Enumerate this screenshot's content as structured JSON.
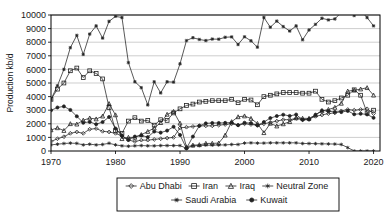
{
  "chart_data": {
    "type": "line",
    "title": "",
    "xlabel": "",
    "ylabel": "Production kb/d",
    "xlim": [
      1970,
      2021
    ],
    "ylim": [
      0,
      10000
    ],
    "ytick_step": 1000,
    "grid": "horizontal",
    "legend_position": "bottom",
    "xticks": [
      "1970",
      "1980",
      "1990",
      "2000",
      "2010",
      "2020"
    ],
    "xtick_values": [
      1970,
      1980,
      1990,
      2000,
      2010,
      2020
    ],
    "yticks": [
      "0",
      "1000",
      "2000",
      "3000",
      "4000",
      "5000",
      "6000",
      "7000",
      "8000",
      "9000",
      "10000"
    ],
    "ytick_values": [
      0,
      1000,
      2000,
      3000,
      4000,
      5000,
      6000,
      7000,
      8000,
      9000,
      10000
    ],
    "x": [
      1970,
      1971,
      1972,
      1973,
      1974,
      1975,
      1976,
      1977,
      1978,
      1979,
      1980,
      1981,
      1982,
      1983,
      1984,
      1985,
      1986,
      1987,
      1988,
      1989,
      1990,
      1991,
      1992,
      1993,
      1994,
      1995,
      1996,
      1997,
      1998,
      1999,
      2000,
      2001,
      2002,
      2003,
      2004,
      2005,
      2006,
      2007,
      2008,
      2009,
      2010,
      2011,
      2012,
      2013,
      2014,
      2015,
      2016,
      2017,
      2018,
      2019,
      2020
    ],
    "series": [
      {
        "name": "Abu Dhabi",
        "marker": "diamond",
        "values": [
          700,
          900,
          1050,
          1300,
          1400,
          1300,
          1600,
          1650,
          1450,
          1400,
          1300,
          1100,
          800,
          700,
          800,
          800,
          850,
          900,
          950,
          1000,
          1700,
          1750,
          1800,
          1850,
          1850,
          1850,
          1900,
          1950,
          2000,
          1900,
          2000,
          1950,
          1900,
          2000,
          2100,
          2200,
          2300,
          2300,
          2400,
          2300,
          2350,
          2550,
          2650,
          2750,
          2800,
          2950,
          3050,
          3000,
          3050,
          3100,
          2750
        ]
      },
      {
        "name": "Iran",
        "marker": "square",
        "values": [
          3800,
          4550,
          5000,
          5900,
          6100,
          5400,
          5900,
          5700,
          5300,
          3200,
          1500,
          1300,
          2200,
          2450,
          2200,
          2250,
          1900,
          2300,
          2250,
          2800,
          3100,
          3350,
          3450,
          3600,
          3650,
          3700,
          3700,
          3700,
          3800,
          3550,
          3800,
          3750,
          3400,
          4000,
          4100,
          4200,
          4300,
          4300,
          4300,
          4250,
          4250,
          4400,
          3800,
          3600,
          3700,
          3900,
          4100,
          4500,
          4100,
          2800,
          3000
        ]
      },
      {
        "name": "Iraq",
        "marker": "triangle",
        "values": [
          1550,
          1700,
          1500,
          2000,
          1970,
          2260,
          2420,
          2350,
          2560,
          3480,
          2650,
          900,
          1000,
          1000,
          1200,
          1430,
          1690,
          2080,
          2690,
          2900,
          2040,
          300,
          425,
          455,
          555,
          560,
          580,
          1160,
          2150,
          2510,
          2570,
          2390,
          2020,
          1340,
          2030,
          1830,
          1990,
          2150,
          2430,
          2400,
          2400,
          2650,
          2950,
          3050,
          3200,
          3500,
          4400,
          4470,
          4550,
          4650,
          4100
        ]
      },
      {
        "name": "Neutral Zone",
        "marker": "asterisk",
        "values": [
          450,
          500,
          550,
          580,
          560,
          450,
          500,
          450,
          480,
          570,
          450,
          380,
          350,
          380,
          400,
          380,
          380,
          400,
          400,
          400,
          400,
          200,
          380,
          400,
          430,
          430,
          440,
          450,
          480,
          480,
          580,
          600,
          580,
          580,
          600,
          600,
          600,
          600,
          600,
          550,
          550,
          540,
          530,
          520,
          510,
          480,
          250,
          0,
          0,
          0,
          0
        ]
      },
      {
        "name": "Saudi Arabia",
        "marker": "star",
        "values": [
          3800,
          4800,
          6000,
          7600,
          8500,
          7100,
          8600,
          9200,
          8300,
          9530,
          9900,
          9815,
          6500,
          5090,
          4660,
          3390,
          5090,
          4270,
          5090,
          5060,
          6410,
          8120,
          8330,
          8200,
          8120,
          8230,
          8220,
          8360,
          8390,
          7830,
          8400,
          8100,
          7630,
          9820,
          9100,
          9550,
          9150,
          8820,
          9200,
          8180,
          8900,
          9310,
          9760,
          9640,
          9710,
          10190,
          10460,
          9960,
          10320,
          9810,
          9200
        ]
      },
      {
        "name": "Kuwait",
        "marker": "dot",
        "values": [
          2990,
          3200,
          3280,
          3020,
          2550,
          2080,
          2140,
          1970,
          2130,
          2500,
          1660,
          1130,
          820,
          1060,
          1150,
          1020,
          1430,
          1350,
          1500,
          1780,
          1180,
          190,
          1060,
          1850,
          2030,
          2060,
          2060,
          2070,
          2090,
          1900,
          2080,
          2050,
          1880,
          2130,
          2420,
          2570,
          2670,
          2580,
          2680,
          2290,
          2310,
          2660,
          2980,
          2930,
          2870,
          2860,
          2950,
          2700,
          2740,
          2690,
          2440
        ]
      }
    ]
  },
  "legend": {
    "items": [
      {
        "label": "Abu Dhabi",
        "marker": "diamond"
      },
      {
        "label": "Iran",
        "marker": "square"
      },
      {
        "label": "Iraq",
        "marker": "triangle"
      },
      {
        "label": "Neutral Zone",
        "marker": "asterisk"
      },
      {
        "label": "Saudi Arabia",
        "marker": "star"
      },
      {
        "label": "Kuwait",
        "marker": "dot"
      }
    ]
  },
  "colors": {
    "line": "#222222",
    "grid": "#b9b9b9",
    "axis": "#000000",
    "background": "#ffffff",
    "text": "#1a1a1a"
  }
}
